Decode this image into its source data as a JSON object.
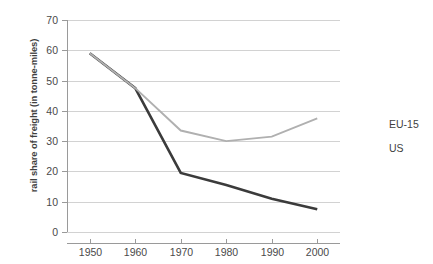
{
  "chart_data": {
    "type": "line",
    "title": "",
    "xlabel": "",
    "ylabel": "rail share of freight (in tonne-miles)",
    "x": [
      1950,
      1960,
      1970,
      1980,
      1990,
      2000
    ],
    "xtick_labels": [
      "1950",
      "1960",
      "1970",
      "1980",
      "1990",
      "2000"
    ],
    "ytick_labels": [
      "0",
      "10",
      "20",
      "30",
      "40",
      "50",
      "60",
      "70"
    ],
    "yticks": [
      0,
      10,
      20,
      30,
      40,
      50,
      60,
      70
    ],
    "xlim": [
      1945,
      2005
    ],
    "ylim": [
      0,
      70
    ],
    "grid": "horizontal",
    "legend_position": "right",
    "series": [
      {
        "name": "EU-15",
        "color": "#3b3b3b",
        "width": 2.6,
        "values": [
          59,
          47.5,
          19.5,
          15.5,
          11,
          7.5
        ]
      },
      {
        "name": "US",
        "color": "#b0b0b0",
        "width": 1.9,
        "values": [
          59,
          47.5,
          33.5,
          30,
          31.5,
          37.5
        ]
      }
    ]
  },
  "legend": {
    "items": [
      {
        "label": "EU-15"
      },
      {
        "label": "US"
      }
    ]
  },
  "axes": {
    "y_title": "rail share of freight (in tonne-miles)"
  }
}
